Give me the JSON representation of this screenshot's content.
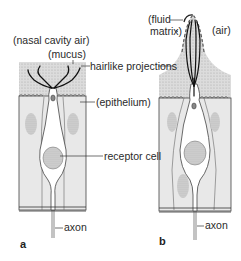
{
  "figure": {
    "panels": [
      {
        "id": "a",
        "label": "a"
      },
      {
        "id": "b",
        "label": "b"
      }
    ],
    "labels": {
      "nasal_cavity_air": "(nasal cavity air)",
      "mucus": "(mucus)",
      "hairlike_projections": "hairlike projections",
      "epithelium": "(epithelium)",
      "receptor_cell": "receptor cell",
      "axon_a": "axon",
      "axon_b": "axon",
      "fluid_line1": "(fluid",
      "fluid_line2": "matrix)",
      "air": "(air)"
    },
    "colors": {
      "tissue_fill": "#e6e6e6",
      "mucus_fill": "#d4d4d4",
      "line": "#333333",
      "cell_fill": "#ffffff",
      "nucleus_fill": "#c8c8c8"
    }
  }
}
